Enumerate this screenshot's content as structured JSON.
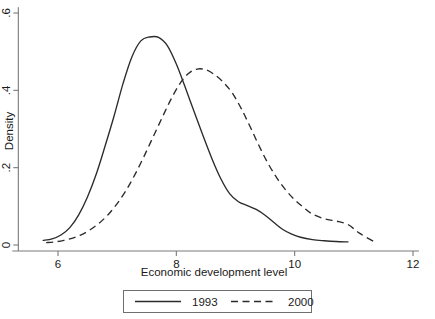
{
  "chart_data": {
    "type": "line",
    "title": "",
    "subtitle": "",
    "xlabel": "Economic development level",
    "ylabel": "Density",
    "xlim": [
      5.6,
      12.1
    ],
    "ylim": [
      0,
      0.615
    ],
    "xticks": [
      6,
      8,
      10,
      12
    ],
    "xticklabels": [
      "6",
      "8",
      "10",
      "12"
    ],
    "yticks": [
      0,
      0.2,
      0.4,
      0.6
    ],
    "yticklabels": [
      "0",
      ".2",
      ".4",
      ".6"
    ],
    "grid": false,
    "legend_position": "below-axes",
    "series": [
      {
        "name": "1993",
        "style": "solid",
        "color": "#2b2b2b",
        "x": [
          5.75,
          5.9,
          6.05,
          6.2,
          6.35,
          6.5,
          6.65,
          6.8,
          6.95,
          7.1,
          7.25,
          7.4,
          7.55,
          7.7,
          7.85,
          8.0,
          8.15,
          8.3,
          8.45,
          8.6,
          8.75,
          8.9,
          9.05,
          9.2,
          9.35,
          9.5,
          9.65,
          9.8,
          9.95,
          10.1,
          10.3,
          10.5,
          10.7,
          10.9
        ],
        "y": [
          0.012,
          0.016,
          0.026,
          0.045,
          0.078,
          0.125,
          0.185,
          0.258,
          0.335,
          0.418,
          0.487,
          0.528,
          0.538,
          0.537,
          0.515,
          0.468,
          0.408,
          0.345,
          0.283,
          0.224,
          0.172,
          0.133,
          0.112,
          0.102,
          0.092,
          0.077,
          0.058,
          0.04,
          0.028,
          0.02,
          0.014,
          0.011,
          0.009,
          0.008
        ]
      },
      {
        "name": "2000",
        "style": "dashed",
        "color": "#2b2b2b",
        "x": [
          5.8,
          5.95,
          6.1,
          6.25,
          6.4,
          6.55,
          6.7,
          6.85,
          7.0,
          7.15,
          7.3,
          7.45,
          7.6,
          7.75,
          7.9,
          8.05,
          8.2,
          8.35,
          8.5,
          8.65,
          8.8,
          8.95,
          9.1,
          9.25,
          9.4,
          9.55,
          9.7,
          9.85,
          10.0,
          10.15,
          10.3,
          10.5,
          10.7,
          10.9,
          11.1,
          11.35
        ],
        "y": [
          0.006,
          0.008,
          0.012,
          0.018,
          0.027,
          0.04,
          0.057,
          0.079,
          0.107,
          0.141,
          0.182,
          0.228,
          0.277,
          0.326,
          0.374,
          0.415,
          0.443,
          0.455,
          0.453,
          0.44,
          0.42,
          0.392,
          0.352,
          0.305,
          0.256,
          0.211,
          0.173,
          0.142,
          0.117,
          0.097,
          0.08,
          0.068,
          0.062,
          0.053,
          0.03,
          0.008
        ]
      }
    ]
  },
  "legend": {
    "entries": [
      {
        "label": "1993",
        "style": "solid"
      },
      {
        "label": "2000",
        "style": "dashed"
      }
    ]
  }
}
